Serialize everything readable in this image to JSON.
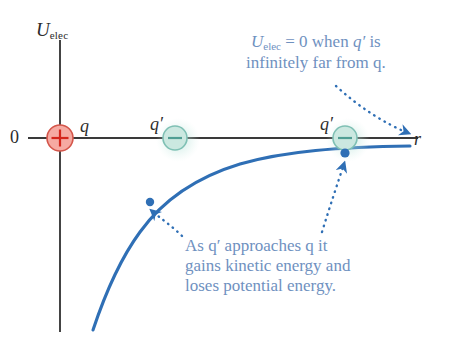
{
  "figure": {
    "title_fragment": "",
    "background": "#ffffff",
    "width": 455,
    "height": 341
  },
  "axes": {
    "y_axis": {
      "label_main": "U",
      "label_sub": "elec",
      "x": 60,
      "y_top": 40,
      "y_bottom": 330,
      "color": "#333333"
    },
    "x_axis": {
      "label": "r",
      "y": 138,
      "x_left": 28,
      "x_right": 420,
      "color": "#333333"
    },
    "origin_label": "0"
  },
  "charges": [
    {
      "name": "source-charge",
      "label": "q",
      "sign": "+",
      "x": 60,
      "y": 138,
      "radius": 13,
      "fill": "#f6aaa2",
      "stroke": "#d4564b",
      "glyph_color": "#d4261c",
      "glow": false
    },
    {
      "name": "test-charge-near",
      "label": "q′",
      "sign": "−",
      "x": 175,
      "y": 138,
      "radius": 12,
      "fill": "#cbe8e0",
      "stroke": "#7fc0b4",
      "glyph_color": "#4f9e93",
      "glow": true
    },
    {
      "name": "test-charge-far",
      "label": "q′",
      "sign": "−",
      "x": 345,
      "y": 138,
      "radius": 12,
      "fill": "#cbe8e0",
      "stroke": "#7fc0b4",
      "glyph_color": "#4f9e93",
      "glow": true
    }
  ],
  "curve": {
    "name": "potential-energy-curve",
    "color": "#2f6fb5",
    "width": 3,
    "description": "negative 1/r potential energy curve rising toward zero asymptote"
  },
  "markers": [
    {
      "name": "curve-point-near",
      "x": 150,
      "y": 202,
      "color": "#2f6fb5"
    },
    {
      "name": "curve-point-far",
      "x": 345,
      "y": 153,
      "color": "#2f6fb5"
    }
  ],
  "annotations": {
    "top": {
      "name": "annotation-zero-at-infinity",
      "line1_pre": "U",
      "line1_sub": "elec",
      "line1_mid": " = 0 when ",
      "line1_q": "q′",
      "line1_post": " is",
      "line2": "infinitely far from q.",
      "color": "#6f91bf",
      "x": 248,
      "y": 36
    },
    "bottom": {
      "name": "annotation-energy-exchange",
      "line1": "As q′ approaches q it",
      "line2": "gains kinetic energy and",
      "line3": "loses potential energy.",
      "color": "#6f91bf",
      "x": 185,
      "y": 240
    }
  },
  "pointers": [
    {
      "name": "pointer-to-r-axis-tip",
      "color": "#2f6fb5",
      "style": "dotted-curved-arrow"
    },
    {
      "name": "pointer-to-curve-point-far",
      "color": "#2f6fb5",
      "style": "dotted-curved-arrow"
    },
    {
      "name": "pointer-to-curve-point-near",
      "color": "#2f6fb5",
      "style": "dotted-curved-arrow"
    }
  ]
}
